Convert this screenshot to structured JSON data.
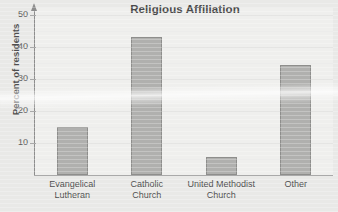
{
  "chart_data": {
    "type": "bar",
    "title": "Religious Affiliation",
    "xlabel": "",
    "ylabel": "Percent of residents",
    "categories": [
      "Evangelical Lutheran",
      "Catholic Church",
      "United Methodist Church",
      "Other"
    ],
    "category_lines": [
      [
        "Evangelical",
        "Lutheran"
      ],
      [
        "Catholic",
        "Church"
      ],
      [
        "United Methodist",
        "Church"
      ],
      [
        "Other",
        ""
      ]
    ],
    "values": [
      15,
      43,
      5.5,
      34.5
    ],
    "ylim": [
      0,
      52
    ],
    "yticks": [
      10,
      20,
      30,
      40,
      50
    ],
    "ytick_labels": [
      "10",
      "20",
      "30",
      "40",
      "50"
    ],
    "grid": true,
    "legend": "none",
    "bar_fill": "#b0b0ae",
    "bar_border": "#8e8e8c",
    "axis_color": "#8d8d8d",
    "background": "#e9e9e7",
    "plot_background": "#efefed"
  }
}
